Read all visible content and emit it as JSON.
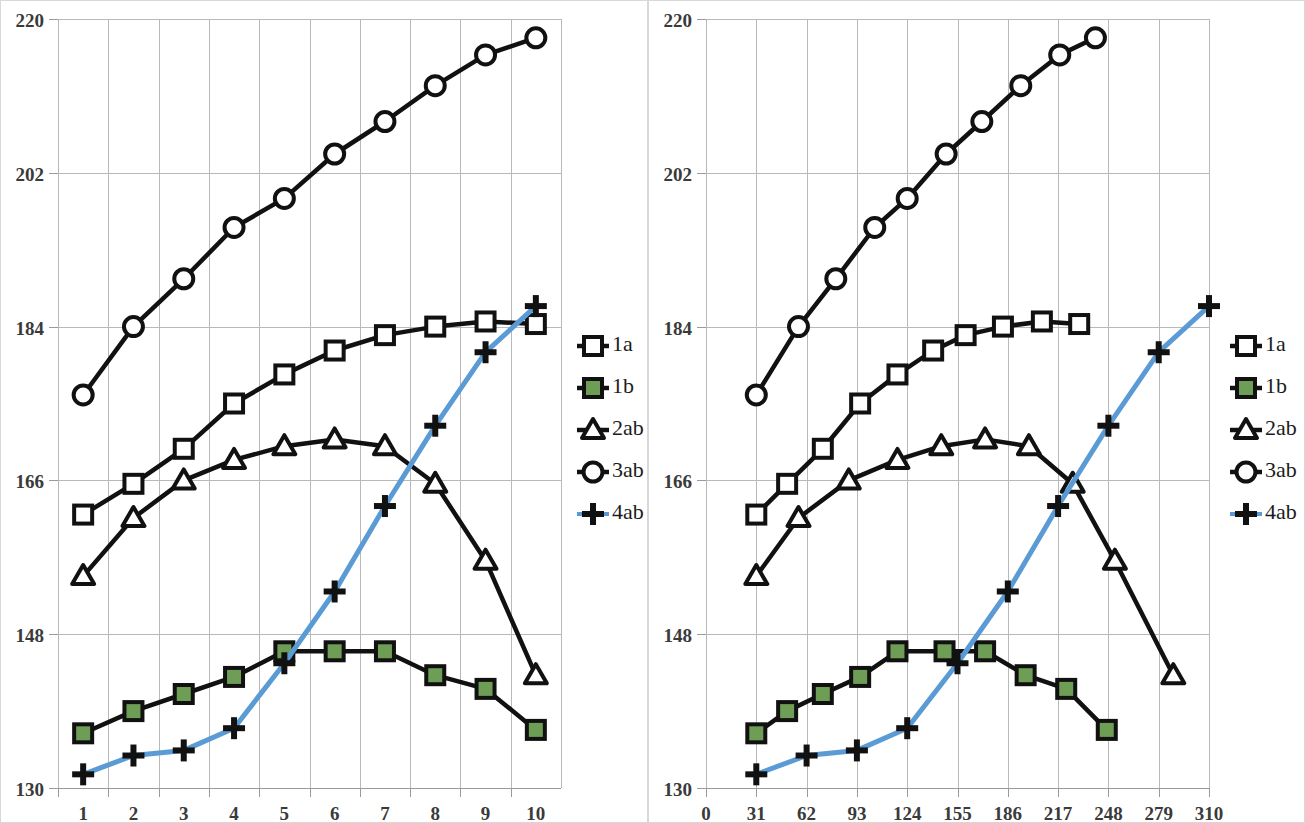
{
  "colors": {
    "series_black": "#111111",
    "series_blue": "#5B9BD5",
    "marker_green": "#6E9D55",
    "gridline": "#b9b9b9",
    "axis": "#9a9a9a",
    "text": "#3a3a3a",
    "panel_border": "#d8d8d8",
    "background": "#ffffff"
  },
  "legend": {
    "items": [
      {
        "label": "1a",
        "marker": "open-square",
        "line": "black"
      },
      {
        "label": "1b",
        "marker": "filled-square",
        "line": "black"
      },
      {
        "label": "2ab",
        "marker": "open-triangle",
        "line": "black"
      },
      {
        "label": "3ab",
        "marker": "open-circle",
        "line": "black"
      },
      {
        "label": "4ab",
        "marker": "plus",
        "line": "blue"
      }
    ]
  },
  "chart_data": [
    {
      "id": "left-chart",
      "type": "line",
      "title": "",
      "xlabel": "",
      "ylabel": "",
      "grid": true,
      "legend_position": "right",
      "xlim": [
        0.5,
        10.5
      ],
      "ylim": [
        130,
        220
      ],
      "yticks": [
        130,
        148,
        166,
        184,
        202,
        220
      ],
      "ytick_labels": [
        "130",
        "148",
        "166",
        "184",
        "202",
        "220"
      ],
      "xticks": [
        1,
        2,
        3,
        4,
        5,
        6,
        7,
        8,
        9,
        10
      ],
      "xtick_labels": [
        "1",
        "2",
        "3",
        "4",
        "5",
        "6",
        "7",
        "8",
        "9",
        "10"
      ],
      "x": [
        1,
        2,
        3,
        4,
        5,
        6,
        7,
        8,
        9,
        10
      ],
      "series": [
        {
          "name": "1a",
          "marker": "open-square",
          "line": "black",
          "values": [
            162.0,
            165.6,
            169.7,
            175.0,
            178.4,
            181.2,
            183.0,
            184.0,
            184.6,
            184.3
          ]
        },
        {
          "name": "1b",
          "marker": "filled-square",
          "line": "black",
          "values": [
            136.4,
            139.0,
            141.0,
            143.0,
            146.0,
            146.0,
            146.0,
            143.2,
            141.6,
            136.8
          ]
        },
        {
          "name": "2ab",
          "marker": "open-triangle",
          "line": "black",
          "values": [
            154.8,
            161.6,
            166.0,
            168.4,
            170.0,
            170.8,
            170.0,
            165.6,
            156.6,
            143.2
          ]
        },
        {
          "name": "3ab",
          "marker": "open-circle",
          "line": "black",
          "values": [
            176.0,
            184.0,
            189.6,
            195.6,
            199.0,
            204.2,
            208.0,
            212.2,
            215.8,
            217.8
          ]
        },
        {
          "name": "4ab",
          "marker": "plus",
          "line": "blue",
          "values": [
            131.6,
            133.8,
            134.4,
            137.0,
            144.6,
            153.0,
            163.0,
            172.4,
            181.0,
            186.4
          ]
        }
      ]
    },
    {
      "id": "right-chart",
      "type": "line",
      "title": "",
      "xlabel": "",
      "ylabel": "",
      "grid": true,
      "legend_position": "right",
      "xlim": [
        0,
        310
      ],
      "ylim": [
        130,
        220
      ],
      "yticks": [
        130,
        148,
        166,
        184,
        202,
        220
      ],
      "ytick_labels": [
        "130",
        "148",
        "166",
        "184",
        "202",
        "220"
      ],
      "xticks": [
        0,
        31,
        62,
        93,
        124,
        155,
        186,
        217,
        248,
        279,
        310
      ],
      "xtick_labels": [
        "0",
        "31",
        "62",
        "93",
        "124",
        "155",
        "186",
        "217",
        "248",
        "279",
        "310"
      ],
      "series": [
        {
          "name": "1a",
          "marker": "open-square",
          "line": "black",
          "x": [
            31,
            50,
            72,
            95,
            118,
            140,
            160,
            183,
            207,
            230
          ],
          "values": [
            162.0,
            165.6,
            169.7,
            175.0,
            178.4,
            181.2,
            183.0,
            184.0,
            184.6,
            184.3
          ]
        },
        {
          "name": "1b",
          "marker": "filled-square",
          "line": "black",
          "x": [
            31,
            50,
            72,
            95,
            118,
            147,
            172,
            197,
            222,
            247
          ],
          "values": [
            136.4,
            139.0,
            141.0,
            143.0,
            146.0,
            146.0,
            146.0,
            143.2,
            141.6,
            136.8
          ]
        },
        {
          "name": "2ab",
          "marker": "open-triangle",
          "line": "black",
          "x": [
            31,
            57,
            88,
            118,
            145,
            172,
            199,
            226,
            252,
            288
          ],
          "values": [
            154.8,
            161.6,
            166.0,
            168.4,
            170.0,
            170.8,
            170.0,
            165.6,
            156.6,
            143.2
          ]
        },
        {
          "name": "3ab",
          "marker": "open-circle",
          "line": "black",
          "x": [
            31,
            57,
            80,
            104,
            124,
            148,
            170,
            194,
            218,
            240
          ],
          "values": [
            176.0,
            184.0,
            189.6,
            195.6,
            199.0,
            204.2,
            208.0,
            212.2,
            215.8,
            217.8
          ]
        },
        {
          "name": "4ab",
          "marker": "plus",
          "line": "blue",
          "x": [
            31,
            62,
            93,
            124,
            155,
            186,
            217,
            248,
            279,
            310
          ],
          "values": [
            131.6,
            133.8,
            134.4,
            137.0,
            144.6,
            153.0,
            163.0,
            172.4,
            181.0,
            186.4
          ]
        }
      ]
    }
  ]
}
